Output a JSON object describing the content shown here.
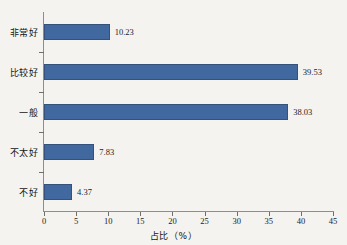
{
  "chart_data": {
    "type": "bar",
    "orientation": "horizontal",
    "title": "",
    "xlabel": "占比（%）",
    "ylabel": "",
    "categories": [
      "非常好",
      "比较好",
      "一般",
      "不太好",
      "不好"
    ],
    "values": [
      10.23,
      39.53,
      38.03,
      7.83,
      4.37
    ],
    "value_labels": [
      "10.23",
      "39.53",
      "38.03",
      "7.83",
      "4.37"
    ],
    "xlim": [
      0,
      45
    ],
    "xticks": [
      0,
      5,
      10,
      15,
      20,
      25,
      30,
      35,
      40,
      45
    ],
    "xtick_labels": [
      "0",
      "5",
      "10",
      "15",
      "20",
      "25",
      "30",
      "35",
      "40",
      "45"
    ],
    "grid": false,
    "legend": false,
    "series": [
      {
        "name": "占比",
        "values": [
          10.23,
          39.53,
          38.03,
          7.83,
          4.37
        ],
        "color": "#41699f"
      }
    ]
  },
  "colors": {
    "bar": "#41699f",
    "bar_border": "#35527c",
    "axis": "#8d8d8a",
    "text": "#141414",
    "background": "#f4f3f0"
  }
}
